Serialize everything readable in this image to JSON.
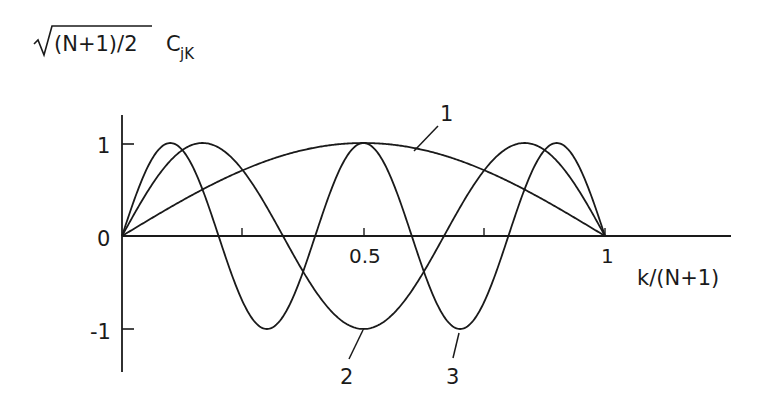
{
  "chart_data": {
    "type": "line",
    "title": "",
    "ylabel": "√(N+1)/2 C_jK",
    "ylabel_parts": {
      "sqrt_arg": "(N+1)/2",
      "symbol": "C",
      "subscript": "jK"
    },
    "xlabel": "k/(N+1)",
    "xlim": [
      0,
      1.25
    ],
    "ylim": [
      -1.3,
      1.3
    ],
    "x_ticks": [
      0.25,
      0.5,
      0.75,
      1
    ],
    "x_tick_labels": [
      {
        "x": 0.5,
        "label": "0.5"
      },
      {
        "x": 1,
        "label": "1"
      }
    ],
    "y_ticks": [
      {
        "y": 1,
        "label": "1"
      },
      {
        "y": 0,
        "label": "0"
      },
      {
        "y": -1,
        "label": "-1"
      }
    ],
    "grid": false,
    "legend": "none (curves labelled directly)",
    "series": [
      {
        "name": "1",
        "formula": "sin(pi*x)",
        "harmonic": 1,
        "x": [
          0,
          0.1,
          0.2,
          0.3,
          0.4,
          0.5,
          0.6,
          0.7,
          0.8,
          0.9,
          1.0
        ],
        "y": [
          0,
          0.31,
          0.59,
          0.81,
          0.95,
          1.0,
          0.95,
          0.81,
          0.59,
          0.31,
          0
        ]
      },
      {
        "name": "2",
        "formula": "sin(3*pi*x)",
        "harmonic": 3,
        "x": [
          0,
          0.1,
          0.1667,
          0.2,
          0.3,
          0.333,
          0.4,
          0.5,
          0.6,
          0.667,
          0.7,
          0.8,
          0.8333,
          0.9,
          1.0
        ],
        "y": [
          0,
          0.81,
          1.0,
          0.95,
          -0.31,
          0,
          -0.59,
          -1.0,
          -0.59,
          0,
          -0.31,
          0.95,
          1.0,
          0.81,
          0
        ]
      },
      {
        "name": "3",
        "formula": "sin(5*pi*x)",
        "harmonic": 5,
        "x": [
          0,
          0.1,
          0.2,
          0.3,
          0.4,
          0.5,
          0.6,
          0.7,
          0.8,
          0.9,
          1.0
        ],
        "y": [
          0,
          1.0,
          0,
          -1.0,
          0,
          1.0,
          0,
          -1.0,
          0,
          1.0,
          0
        ]
      }
    ],
    "annotations": [
      {
        "text": "1",
        "points_to": {
          "x": 0.58,
          "y": 0.97
        }
      },
      {
        "text": "2",
        "points_to": {
          "x": 0.5,
          "y": -1.0
        }
      },
      {
        "text": "3",
        "points_to": {
          "x": 0.7,
          "y": -1.0
        }
      }
    ]
  },
  "labels": {
    "y_sqrt_arg": "(N+1)/2",
    "y_symbol": "C",
    "y_subscript": "jK",
    "x_axis": "k/(N+1)",
    "tick_05": "0.5",
    "tick_1": "1",
    "ytick_1": "1",
    "ytick_0": "0",
    "ytick_m1": "-1",
    "curve1": "1",
    "curve2": "2",
    "curve3": "3"
  }
}
